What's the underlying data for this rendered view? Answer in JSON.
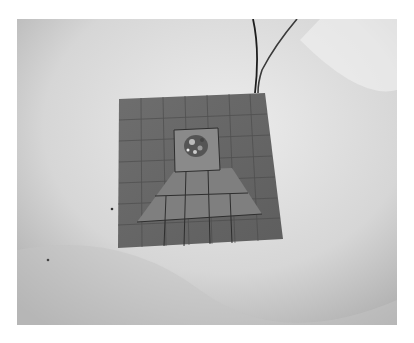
{
  "image": {
    "description": "Grayscale photograph of a square tiled board with a central sample on a white cloth, two wires leading off the top edge",
    "colors": {
      "page_background": "#ffffff",
      "cloth_light": "#e4e4e4",
      "cloth_shadow": "#b8b8b8",
      "board": "#6a6a6a",
      "board_light": "#858585",
      "grout": "#3a3a3a",
      "wire": "#2a2a2a"
    }
  }
}
